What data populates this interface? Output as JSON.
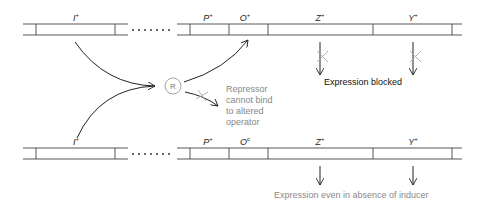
{
  "diagram": {
    "top_strand": {
      "genes": [
        {
          "name": "I",
          "superscript": "+",
          "x": 76
        },
        {
          "name": "P",
          "superscript": "+",
          "x": 208
        },
        {
          "name": "O",
          "superscript": "+",
          "x": 243
        },
        {
          "name": "Z",
          "superscript": "+",
          "x": 319
        },
        {
          "name": "Y",
          "superscript": "+",
          "x": 412
        }
      ],
      "outcome": "Expression blocked"
    },
    "bottom_strand": {
      "genes": [
        {
          "name": "I",
          "superscript": "+",
          "x": 76
        },
        {
          "name": "P",
          "superscript": "+",
          "x": 208
        },
        {
          "name": "O",
          "superscript": "c",
          "x": 243
        },
        {
          "name": "Z",
          "superscript": "+",
          "x": 319
        },
        {
          "name": "Y",
          "superscript": "+",
          "x": 412
        }
      ],
      "outcome": "Expression even in absence of inducer"
    },
    "repressor": {
      "label": "R",
      "note_lines": [
        "Repressor",
        "cannot bind",
        "to altered",
        "operator"
      ]
    },
    "colors": {
      "line": "#333333",
      "blocked_x": "#aaaaaa",
      "note_text": "#888888"
    }
  }
}
